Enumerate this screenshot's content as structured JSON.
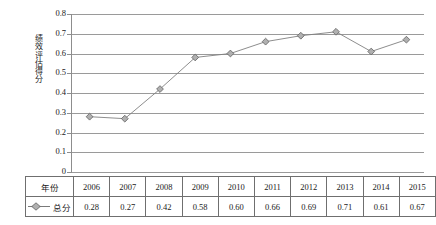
{
  "chart_data": {
    "type": "line",
    "title": "",
    "subtitle": "",
    "xlabel": "",
    "ylabel": "绩效评估得分",
    "categories": [
      "2006",
      "2007",
      "2008",
      "2009",
      "2010",
      "2011",
      "2012",
      "2013",
      "2014",
      "2015"
    ],
    "series": [
      {
        "name": "总分",
        "values": [
          0.28,
          0.27,
          0.42,
          0.58,
          0.6,
          0.66,
          0.69,
          0.71,
          0.61,
          0.67
        ],
        "marker": "diamond",
        "line_color": "#808080",
        "marker_fill": "#b0b0b0",
        "marker_edge": "#666666"
      }
    ],
    "ylim": [
      0,
      0.8
    ],
    "ytick_values": [
      0,
      0.1,
      0.2,
      0.3,
      0.4,
      0.5,
      0.6,
      0.7,
      0.8
    ],
    "ytick_labels": [
      "0",
      "0.1",
      "0.2",
      "0.3",
      "0.4",
      "0.5",
      "0.6",
      "0.7",
      "0.8"
    ],
    "grid": true,
    "grid_axis": "y",
    "legend_position": "data-table",
    "annotations": []
  },
  "data_table": {
    "row_header_year": "年份",
    "row_header_total": "总分",
    "years": [
      "2006",
      "2007",
      "2008",
      "2009",
      "2010",
      "2011",
      "2012",
      "2013",
      "2014",
      "2015"
    ],
    "totals": [
      "0.28",
      "0.27",
      "0.42",
      "0.58",
      "0.60",
      "0.66",
      "0.69",
      "0.71",
      "0.61",
      "0.67"
    ]
  },
  "axis": {
    "y_title": "绩效评估得分",
    "y_labels": [
      "0.8",
      "0.7",
      "0.6",
      "0.5",
      "0.4",
      "0.3",
      "0.2",
      "0.1",
      "0"
    ]
  }
}
